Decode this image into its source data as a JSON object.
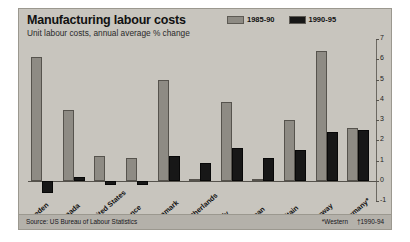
{
  "chart_data": {
    "type": "bar",
    "title": "Manufacturing labour costs",
    "subtitle": "Unit labour costs, annual average % change",
    "xlabel": "",
    "ylabel": "",
    "ylim": [
      -1,
      7
    ],
    "grid": false,
    "legend_position": "top-right",
    "categories": [
      "Sweden",
      "Canada",
      "United States",
      "France",
      "Denmark",
      "Netherlands",
      "Italy",
      "Japan",
      "Britain",
      "Norway",
      "Germany*"
    ],
    "series": [
      {
        "name": "1985-90",
        "color": "#8e8b84",
        "values": [
          6.1,
          3.5,
          1.2,
          1.1,
          5.0,
          0.1,
          3.9,
          0.1,
          3.0,
          6.4,
          2.6
        ]
      },
      {
        "name": "1990-95",
        "color": "#171717",
        "values": [
          -0.6,
          0.2,
          -0.2,
          -0.2,
          1.2,
          0.9,
          1.6,
          1.1,
          1.5,
          2.4,
          2.5
        ]
      }
    ],
    "yticks": [
      7,
      6,
      5,
      4,
      3,
      2,
      1,
      0,
      -1
    ],
    "ytick_labels": [
      "7",
      "6",
      "5",
      "4",
      "3",
      "2",
      "1",
      "0",
      "-1"
    ],
    "source": "Source: US Bureau of Labour Statistics",
    "footnotes": [
      "*Western",
      "†1990-94"
    ]
  }
}
